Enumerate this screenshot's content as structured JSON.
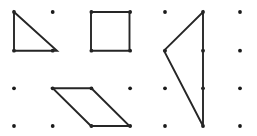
{
  "figure": {
    "background_color": "#ffffff",
    "width": 257,
    "height": 136
  },
  "grid": {
    "name": "dot-lattice",
    "columns": 7,
    "rows": 4,
    "x_positions": [
      14,
      52.7,
      91.4,
      130.1,
      165,
      203,
      240
    ],
    "y_positions": [
      12,
      50.7,
      88.3,
      126
    ],
    "dot_radius": 1.9,
    "dot_color": "#1a1a1a",
    "spacing_x": 37.7,
    "spacing_y": 38
  },
  "chart_data": {
    "type": "scatter",
    "xlabel": "",
    "ylabel": "",
    "grid": true,
    "legend": "none"
  },
  "shapes": [
    {
      "id": "right-triangle",
      "label": "Right triangle",
      "sides": 3,
      "stroke_color": "#262626",
      "stroke_width": 1.9,
      "fill": "none",
      "closed": true,
      "points": "14,12 14,50.7 57,50.7",
      "vertices": [
        {
          "x": 14,
          "y": 12
        },
        {
          "x": 14,
          "y": 50.7
        },
        {
          "x": 57,
          "y": 50.7
        }
      ]
    },
    {
      "id": "square",
      "label": "Square",
      "sides": 4,
      "stroke_color": "#262626",
      "stroke_width": 1.9,
      "fill": "none",
      "closed": true,
      "points": "91,12 129.5,12 129.5,50.7 91,50.7",
      "vertices": [
        {
          "x": 91,
          "y": 12
        },
        {
          "x": 129.5,
          "y": 12
        },
        {
          "x": 129.5,
          "y": 50.7
        },
        {
          "x": 91,
          "y": 50.7
        }
      ]
    },
    {
      "id": "left-pointing-triangle",
      "label": "Left-pointing triangle",
      "sides": 3,
      "stroke_color": "#262626",
      "stroke_width": 1.9,
      "fill": "none",
      "closed": true,
      "points": "203,12 203,126 164,50.7",
      "vertices": [
        {
          "x": 203,
          "y": 12
        },
        {
          "x": 203,
          "y": 126
        },
        {
          "x": 164,
          "y": 50.7
        }
      ]
    },
    {
      "id": "parallelogram",
      "label": "Parallelogram",
      "sides": 4,
      "stroke_color": "#262626",
      "stroke_width": 1.9,
      "fill": "none",
      "closed": true,
      "points": "52.7,88.3 91.4,88.3 129.5,126 91,126",
      "vertices": [
        {
          "x": 52.7,
          "y": 88.3
        },
        {
          "x": 91.4,
          "y": 88.3
        },
        {
          "x": 129.5,
          "y": 126
        },
        {
          "x": 91,
          "y": 126
        }
      ]
    }
  ]
}
